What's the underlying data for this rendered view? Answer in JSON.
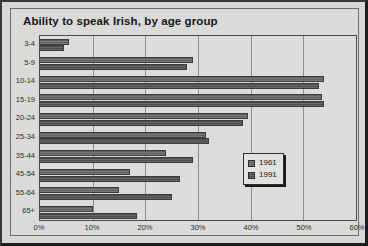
{
  "window": {
    "title": "Ability to speak Irish, by age group"
  },
  "legend": {
    "position": "inside-right",
    "entries": [
      {
        "label": "1961",
        "color": "#6e6e6e"
      },
      {
        "label": "1991",
        "color": "#5a5a5a"
      }
    ]
  },
  "axis": {
    "x_ticks": [
      "0%",
      "10%",
      "20%",
      "30%",
      "40%",
      "50%",
      "60%"
    ],
    "y_ticks": [
      "3-4",
      "5-9",
      "10-14",
      "15-19",
      "20-24",
      "25-34",
      "35-44",
      "45-54",
      "55-64",
      "65+"
    ]
  },
  "chart_data": {
    "type": "bar",
    "orientation": "horizontal",
    "title": "Ability to speak Irish, by age group",
    "xlabel": "",
    "ylabel": "",
    "xlim": [
      0,
      60
    ],
    "xtick_values": [
      0,
      10,
      20,
      30,
      40,
      50,
      60
    ],
    "xtick_labels": [
      "0%",
      "10%",
      "20%",
      "30%",
      "40%",
      "50%",
      "60%"
    ],
    "grid": true,
    "grid_axis": "x",
    "legend_position": "inside-right",
    "categories": [
      "3-4",
      "5-9",
      "10-14",
      "15-19",
      "20-24",
      "25-34",
      "35-44",
      "45-54",
      "55-64",
      "65+"
    ],
    "series": [
      {
        "name": "1961",
        "color": "#6e6e6e",
        "values": [
          5.5,
          29.0,
          54.0,
          53.5,
          39.5,
          31.5,
          24.0,
          17.0,
          15.0,
          10.0
        ]
      },
      {
        "name": "1991",
        "color": "#5a5a5a",
        "values": [
          4.5,
          28.0,
          53.0,
          54.0,
          38.5,
          32.0,
          29.0,
          26.5,
          25.0,
          18.5
        ]
      }
    ]
  }
}
